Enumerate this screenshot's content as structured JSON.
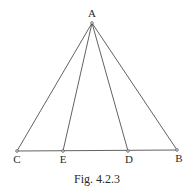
{
  "figure": {
    "caption": "Fig. 4.2.3",
    "points": {
      "A": {
        "label": "A",
        "x": 92,
        "y": 23,
        "label_x": 92,
        "label_y": 17
      },
      "C": {
        "label": "C",
        "x": 17,
        "y": 151,
        "label_x": 17,
        "label_y": 163
      },
      "E": {
        "label": "E",
        "x": 63,
        "y": 151,
        "label_x": 63,
        "label_y": 163
      },
      "D": {
        "label": "D",
        "x": 128,
        "y": 151,
        "label_x": 129,
        "label_y": 163
      },
      "B": {
        "label": "B",
        "x": 177,
        "y": 150,
        "label_x": 179,
        "label_y": 162
      }
    },
    "segments": [
      [
        "A",
        "C"
      ],
      [
        "A",
        "E"
      ],
      [
        "A",
        "D"
      ],
      [
        "A",
        "B"
      ],
      [
        "C",
        "B"
      ]
    ],
    "colors": {
      "stroke": "#3a3a3a",
      "text": "#2a2a2a",
      "background": "#ffffff"
    }
  }
}
